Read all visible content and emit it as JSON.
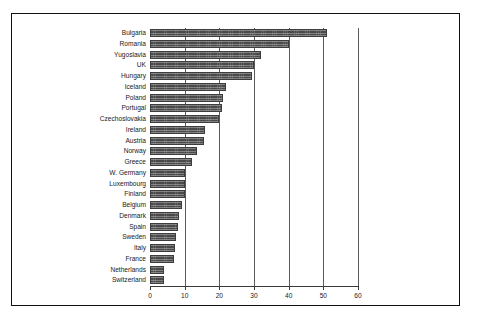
{
  "chart_data": {
    "type": "bar",
    "orientation": "horizontal",
    "title": "",
    "subtitle": "",
    "xlabel": "",
    "ylabel": "",
    "xlim": [
      0,
      60
    ],
    "ylim": null,
    "grid": true,
    "grid_axis": "x",
    "legend": false,
    "legend_position": "none",
    "xticks": [
      0,
      10,
      20,
      30,
      40,
      50,
      60
    ],
    "xtick_labels": [
      "0",
      "10",
      "20",
      "30",
      "40",
      "50",
      "60"
    ],
    "bar_color": "#4a4a4a",
    "background_color": "#ffffff",
    "frame_color": "#111111",
    "categories": [
      "Bulgaria",
      "Romania",
      "Yugoslavia",
      "UK",
      "Hungary",
      "Iceland",
      "Poland",
      "Portugal",
      "Czechoslovakia",
      "Ireland",
      "Austria",
      "Norway",
      "Greece",
      "W. Germany",
      "Luxembourg",
      "Finland",
      "Belgium",
      "Denmark",
      "Spain",
      "Sweden",
      "Italy",
      "France",
      "Netherlands",
      "Switzerland"
    ],
    "values": [
      51,
      40,
      32,
      30,
      29.5,
      22,
      21,
      20.8,
      20,
      16,
      15.5,
      13.5,
      12,
      10,
      10,
      10,
      9.2,
      8.3,
      8.2,
      7.6,
      7.3,
      6.8,
      4,
      3.9
    ]
  }
}
